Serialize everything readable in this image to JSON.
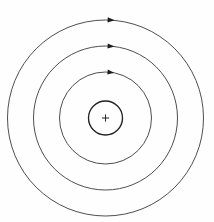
{
  "figure": {
    "width": 214,
    "height": 222,
    "background_color": "#fefefe",
    "center": {
      "x": 105.5,
      "y": 118
    }
  },
  "nucleus": {
    "label": "nucleus",
    "charge_symbol": "+",
    "radius": 17,
    "stroke_color": "#222222",
    "stroke_width": 1.35
  },
  "orbits": [
    {
      "index": 1,
      "label": "inner-orbit",
      "radius": 46,
      "stroke_color": "#3a3a3a",
      "stroke_width": 0.9,
      "arrow": {
        "angle_deg": -84,
        "direction": "clockwise",
        "size": 6.2
      }
    },
    {
      "index": 2,
      "label": "middle-orbit",
      "radius": 72,
      "stroke_color": "#3a3a3a",
      "stroke_width": 0.9,
      "arrow": {
        "angle_deg": -86,
        "direction": "clockwise",
        "size": 6.4
      }
    },
    {
      "index": 3,
      "label": "outer-orbit",
      "radius": 98,
      "stroke_color": "#3a3a3a",
      "stroke_width": 0.9,
      "arrow": {
        "angle_deg": -87,
        "direction": "clockwise",
        "size": 6.6
      }
    }
  ]
}
